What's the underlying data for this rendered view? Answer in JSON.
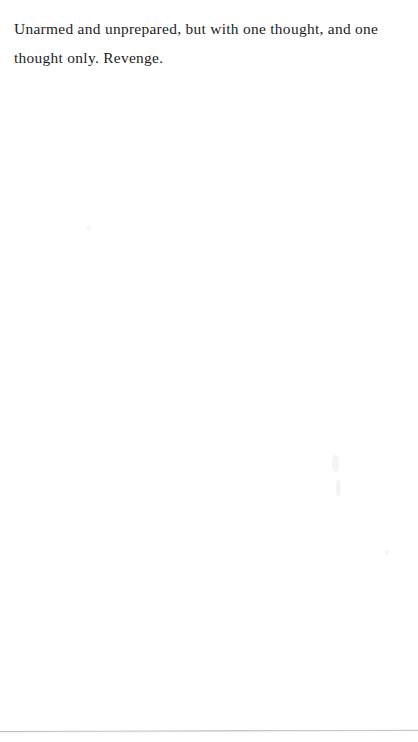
{
  "page": {
    "width": 418,
    "height": 742,
    "background_color": "#ffffff",
    "text_color": "#1c1c1c",
    "rule_color": "#b9babd"
  },
  "body_text": {
    "full_text": "Unarmed and unprepared, but with one thought, and one thought only. Revenge.",
    "lines": [
      "Unarmed and unprepared, but with one thought, and one",
      "thought only. Revenge."
    ]
  },
  "artifacts": {
    "bottom_rule_label": "page-edge-rule",
    "speck_label": "scan-speck"
  }
}
